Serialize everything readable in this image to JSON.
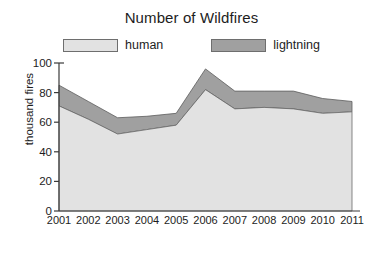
{
  "chart_data": {
    "type": "area",
    "title": "Number of Wildfires",
    "xlabel": "",
    "ylabel": "thousand fires",
    "stacked": true,
    "grid": false,
    "legend_position": "top-center",
    "x": [
      2001,
      2002,
      2003,
      2004,
      2005,
      2006,
      2007,
      2008,
      2009,
      2010,
      2011
    ],
    "categories": [
      "2001",
      "2002",
      "2003",
      "2004",
      "2005",
      "2006",
      "2007",
      "2008",
      "2009",
      "2010",
      "2011"
    ],
    "xlim": [
      2001,
      2011
    ],
    "ylim": [
      0,
      100
    ],
    "yticks": [
      0,
      20,
      40,
      60,
      80,
      100
    ],
    "series": [
      {
        "name": "human",
        "color": "#e2e2e2",
        "values": [
          71,
          62,
          52,
          55,
          58,
          82,
          69,
          70,
          69,
          66,
          67
        ]
      },
      {
        "name": "lightning",
        "color": "#a0a0a0",
        "values": [
          14,
          12,
          11,
          9,
          8,
          14,
          12,
          11,
          12,
          10,
          7
        ]
      }
    ],
    "totals": [
      85,
      74,
      63,
      64,
      66,
      96,
      81,
      81,
      81,
      76,
      74
    ]
  },
  "legend": {
    "items": [
      {
        "label": "human",
        "color": "#e2e2e2"
      },
      {
        "label": "lightning",
        "color": "#a0a0a0"
      }
    ]
  },
  "axes": {
    "y_label": "thousand fires",
    "y_ticks": [
      "0",
      "20",
      "40",
      "60",
      "80",
      "100"
    ],
    "x_ticks": [
      "2001",
      "2002",
      "2003",
      "2004",
      "2005",
      "2006",
      "2007",
      "2008",
      "2009",
      "2010",
      "2011"
    ]
  },
  "style": {
    "axis_color": "#3a3a3a",
    "text_color": "#1d1d1d",
    "background": "#ffffff",
    "human_fill": "#e2e2e2",
    "lightning_fill": "#a0a0a0"
  }
}
